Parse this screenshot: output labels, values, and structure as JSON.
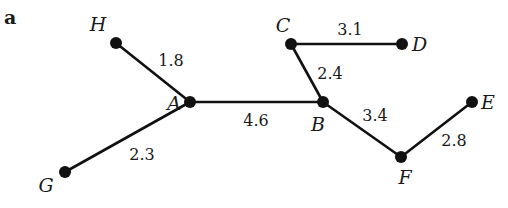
{
  "figure": {
    "panel_label": "a",
    "type": "weighted tree graph"
  },
  "nodes": [
    {
      "id": "A",
      "label": "A",
      "x": 190,
      "y": 102,
      "lx": 174,
      "ly": 110,
      "anchor": "middle"
    },
    {
      "id": "B",
      "label": "B",
      "x": 323,
      "y": 102,
      "lx": 318,
      "ly": 131,
      "anchor": "middle"
    },
    {
      "id": "C",
      "label": "C",
      "x": 291,
      "y": 44,
      "lx": 283,
      "ly": 32,
      "anchor": "middle"
    },
    {
      "id": "D",
      "label": "D",
      "x": 402,
      "y": 44,
      "lx": 412,
      "ly": 51,
      "anchor": "start"
    },
    {
      "id": "E",
      "label": "E",
      "x": 472,
      "y": 102,
      "lx": 481,
      "ly": 109,
      "anchor": "start"
    },
    {
      "id": "F",
      "label": "F",
      "x": 401,
      "y": 157,
      "lx": 405,
      "ly": 184,
      "anchor": "middle"
    },
    {
      "id": "G",
      "label": "G",
      "x": 65,
      "y": 172,
      "lx": 46,
      "ly": 192,
      "anchor": "middle"
    },
    {
      "id": "H",
      "label": "H",
      "x": 116,
      "y": 43,
      "lx": 98,
      "ly": 31,
      "anchor": "middle"
    }
  ],
  "edges": [
    {
      "from": "H",
      "to": "A",
      "weight": "1.8",
      "lx": 171,
      "ly": 66
    },
    {
      "from": "G",
      "to": "A",
      "weight": "2.3",
      "lx": 142,
      "ly": 160
    },
    {
      "from": "A",
      "to": "B",
      "weight": "4.6",
      "lx": 256,
      "ly": 126
    },
    {
      "from": "C",
      "to": "B",
      "weight": "2.4",
      "lx": 330,
      "ly": 79
    },
    {
      "from": "C",
      "to": "D",
      "weight": "3.1",
      "lx": 350,
      "ly": 35
    },
    {
      "from": "B",
      "to": "F",
      "weight": "3.4",
      "lx": 375,
      "ly": 121
    },
    {
      "from": "F",
      "to": "E",
      "weight": "2.8",
      "lx": 454,
      "ly": 146
    }
  ]
}
